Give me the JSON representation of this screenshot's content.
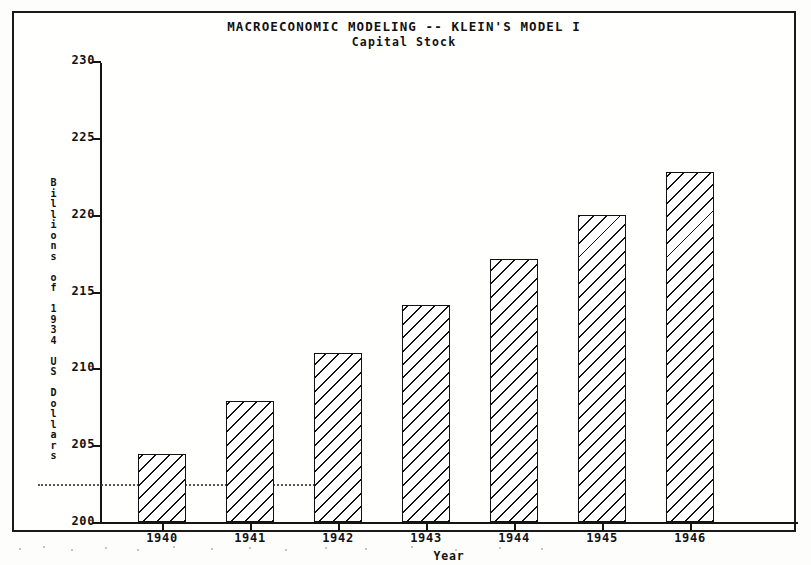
{
  "chart_data": {
    "type": "bar",
    "title": "MACROECONOMIC MODELING -- KLEIN'S MODEL I",
    "subtitle": "Capital Stock",
    "xlabel": "Year",
    "ylabel": "Billions of 1934 US Dollars",
    "categories": [
      "1940",
      "1941",
      "1942",
      "1943",
      "1944",
      "1945",
      "1946"
    ],
    "values": [
      204.4,
      207.9,
      211.0,
      214.1,
      217.1,
      220.0,
      222.8
    ],
    "ylim": [
      200,
      230
    ],
    "yticks": [
      200,
      205,
      210,
      215,
      220,
      225,
      230
    ],
    "ytick_labels": [
      "200",
      "205",
      "210",
      "215",
      "220",
      "225",
      "230"
    ],
    "grid": false,
    "legend": null,
    "annotations": [
      {
        "name": "dotted-reference-line",
        "value": 202.5
      }
    ],
    "bar_style": {
      "fill": "diagonal-hatch",
      "edge_color": "#121212",
      "face_color": "#ffffff"
    }
  },
  "colors": {
    "ink": "#141414",
    "paper": "#fffffd",
    "page": "#fdfdfb"
  }
}
